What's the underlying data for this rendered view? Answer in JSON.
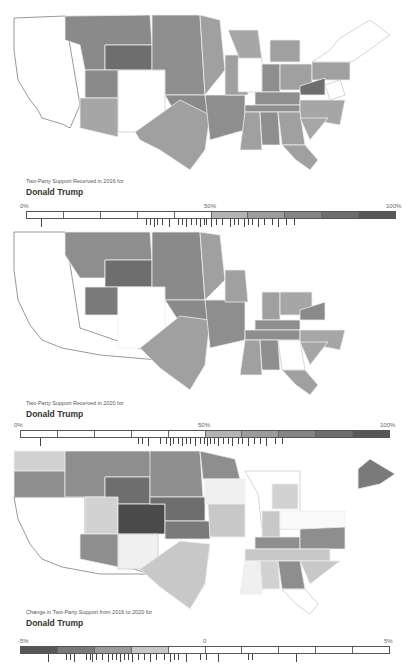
{
  "panels": [
    {
      "subtitle": "Two-Party Support Received in 2016 for",
      "candidate": "Donald Trump",
      "scale": {
        "min_label": "0%",
        "mid_label": "50%",
        "max_label": "100%",
        "segments": [
          "#ffffff",
          "#ffffff",
          "#ffffff",
          "#ffffff",
          "#ffffff",
          "#b4b4b4",
          "#9c9c9c",
          "#858585",
          "#6e6e6e",
          "#575757"
        ]
      }
    },
    {
      "subtitle": "Two-Party Support Received in 2020 for",
      "candidate": "Donald Trump",
      "scale": {
        "min_label": "0%",
        "mid_label": "50%",
        "max_label": "100%",
        "segments": [
          "#ffffff",
          "#ffffff",
          "#ffffff",
          "#ffffff",
          "#ffffff",
          "#b4b4b4",
          "#9c9c9c",
          "#858585",
          "#6e6e6e",
          "#575757"
        ]
      }
    },
    {
      "subtitle": "Change in Two-Party Support from 2016 to 2020 for",
      "candidate": "Donald Trump",
      "scale": {
        "min_label": "-5%",
        "mid_label": "0",
        "max_label": "5%",
        "segments": [
          "#575757",
          "#787878",
          "#9a9a9a",
          "#c8c8c8",
          "#ffffff",
          "#ffffff",
          "#ffffff",
          "#ffffff",
          "#ffffff",
          "#ffffff"
        ]
      }
    }
  ],
  "colors": {
    "background": "#ffffff",
    "border": "#555555",
    "state_border": "#eeeeee"
  }
}
